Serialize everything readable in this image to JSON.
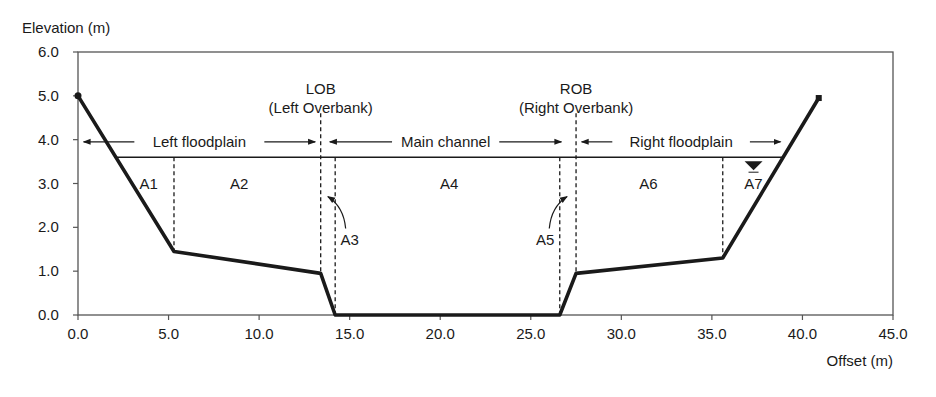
{
  "chart_data": {
    "type": "line",
    "title": "",
    "xlabel": "Offset (m)",
    "ylabel": "Elevation (m)",
    "xlim": [
      0,
      45
    ],
    "ylim": [
      0,
      6
    ],
    "x_ticks": [
      "0.0",
      "5.0",
      "10.0",
      "15.0",
      "20.0",
      "25.0",
      "30.0",
      "35.0",
      "40.0",
      "45.0"
    ],
    "y_ticks": [
      "0.0",
      "1.0",
      "2.0",
      "3.0",
      "4.0",
      "5.0",
      "6.0"
    ],
    "grid": false,
    "series": [
      {
        "name": "Channel cross-section ground profile",
        "x": [
          0.0,
          5.3,
          13.4,
          14.2,
          26.6,
          27.5,
          35.6,
          40.9
        ],
        "y": [
          5.0,
          1.45,
          0.95,
          0.0,
          0.0,
          0.95,
          1.3,
          4.95
        ]
      }
    ],
    "water_surface_elevation": 3.6,
    "water_surface_extent": [
      2.0,
      39.0
    ],
    "subdivision_lines": [
      {
        "x": 5.3,
        "style": "dashed"
      },
      {
        "x": 13.4,
        "style": "dashed",
        "label": "LOB"
      },
      {
        "x": 14.2,
        "style": "dashed"
      },
      {
        "x": 26.6,
        "style": "dashed"
      },
      {
        "x": 27.5,
        "style": "dashed",
        "label": "ROB"
      },
      {
        "x": 35.6,
        "style": "dashed"
      }
    ],
    "areas": [
      {
        "name": "A1",
        "x": 3.9,
        "y": 3.0
      },
      {
        "name": "A2",
        "x": 8.9,
        "y": 3.0
      },
      {
        "name": "A3",
        "x": 15.0,
        "y": 1.7,
        "arrow_to": [
          13.8,
          2.7
        ]
      },
      {
        "name": "A4",
        "x": 20.5,
        "y": 3.0
      },
      {
        "name": "A5",
        "x": 25.8,
        "y": 1.7,
        "arrow_to": [
          27.0,
          2.7
        ]
      },
      {
        "name": "A6",
        "x": 31.5,
        "y": 3.0
      },
      {
        "name": "A7",
        "x": 37.3,
        "y": 3.0
      }
    ],
    "annotations": [
      {
        "text": "LOB",
        "x": 13.4,
        "y": 5.05
      },
      {
        "text": "(Left Overbank)",
        "x": 13.4,
        "y": 4.6
      },
      {
        "text": "ROB",
        "x": 27.5,
        "y": 5.05
      },
      {
        "text": "(Right Overbank)",
        "x": 27.5,
        "y": 4.6
      },
      {
        "text": "Left floodplain",
        "x_range": [
          0.2,
          13.2
        ],
        "y": 3.95
      },
      {
        "text": "Main channel",
        "x_range": [
          13.8,
          26.8
        ],
        "y": 3.95
      },
      {
        "text": "Right floodplain",
        "x_range": [
          27.7,
          38.9
        ],
        "y": 3.95
      }
    ]
  },
  "labels": {
    "y_axis_title": "Elevation (m)",
    "x_axis_title": "Offset (m)",
    "lob": "LOB",
    "lob_full": "(Left Overbank)",
    "rob": "ROB",
    "rob_full": "(Right Overbank)",
    "left_floodplain": "Left floodplain",
    "main_channel": "Main channel",
    "right_floodplain": "Right floodplain"
  },
  "colors": {
    "ink": "#1a1a1a",
    "frame": "#555555",
    "background": "#ffffff"
  }
}
